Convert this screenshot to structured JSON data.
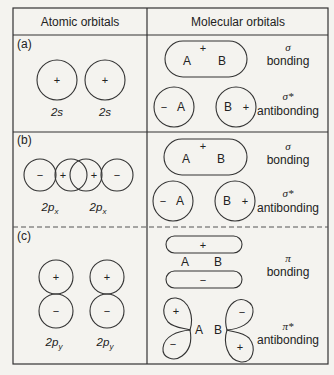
{
  "table": {
    "headers": [
      "Atomic orbitals",
      "Molecular orbitals"
    ]
  },
  "rows": [
    {
      "label": "(a)",
      "atomic": {
        "orbitals": [
          {
            "name": "2s",
            "sign": "+"
          },
          {
            "name": "2s",
            "sign": "+"
          }
        ]
      },
      "molecular": {
        "bonding": {
          "symbol": "σ",
          "text": "bonding",
          "sign": "+",
          "atoms": [
            "A",
            "B"
          ]
        },
        "antibonding": {
          "symbol": "σ*",
          "text": "antibonding",
          "left": {
            "sign": "−",
            "atom": "A"
          },
          "right": {
            "atom": "B",
            "sign": "+"
          }
        }
      }
    },
    {
      "label": "(b)",
      "atomic": {
        "orbitals": [
          {
            "name": "2p",
            "sub": "x",
            "signs": [
              "−",
              "+"
            ]
          },
          {
            "name": "2p",
            "sub": "x",
            "signs": [
              "+",
              "−"
            ]
          }
        ]
      },
      "molecular": {
        "bonding": {
          "symbol": "σ",
          "text": "bonding",
          "sign": "+",
          "atoms": [
            "A",
            "B"
          ]
        },
        "antibonding": {
          "symbol": "σ*",
          "text": "antibonding",
          "left": {
            "sign": "−",
            "atom": "A"
          },
          "right": {
            "atom": "B",
            "sign": "+"
          }
        }
      }
    },
    {
      "label": "(c)",
      "atomic": {
        "orbitals": [
          {
            "name": "2p",
            "sub": "y",
            "signs": [
              "+",
              "−"
            ]
          },
          {
            "name": "2p",
            "sub": "y",
            "signs": [
              "+",
              "−"
            ]
          }
        ]
      },
      "molecular": {
        "bonding": {
          "symbol": "π",
          "text": "bonding",
          "top_sign": "+",
          "bottom_sign": "−",
          "atoms": [
            "A",
            "B"
          ]
        },
        "antibonding": {
          "symbol": "π*",
          "text": "antibonding",
          "left": {
            "signs": [
              "+",
              "−"
            ],
            "atom": "A"
          },
          "right": {
            "signs": [
              "−",
              "+"
            ],
            "atom": "B"
          }
        }
      }
    }
  ]
}
